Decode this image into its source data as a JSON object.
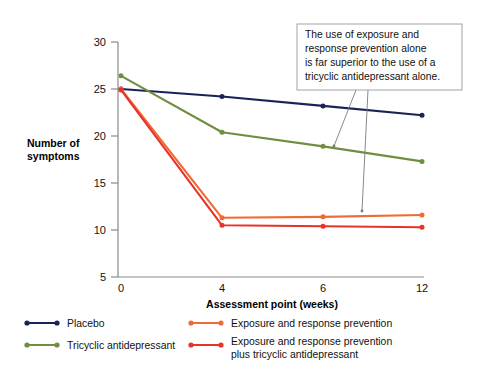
{
  "chart_data": {
    "type": "line",
    "title": "",
    "xlabel": "Assessment point (weeks)",
    "ylabel": "Number of symptoms",
    "categories": [
      "0",
      "4",
      "6",
      "12"
    ],
    "ylim": [
      5,
      30
    ],
    "yticks": [
      5,
      10,
      15,
      20,
      25,
      30
    ],
    "grid": false,
    "legend_position": "bottom",
    "series": [
      {
        "name": "Placebo",
        "color": "#1b2257",
        "values": [
          25.0,
          24.2,
          23.2,
          22.2
        ]
      },
      {
        "name": "Tricyclic antidepressant",
        "color": "#6f8e3f",
        "values": [
          26.4,
          20.4,
          18.9,
          17.3
        ]
      },
      {
        "name": "Exposure and response prevention",
        "color": "#ef6b35",
        "values": [
          25.0,
          11.3,
          11.4,
          11.6
        ]
      },
      {
        "name": "Exposure and response prevention plus tricyclic antidepressant",
        "color": "#e8332a",
        "values": [
          24.9,
          10.5,
          10.4,
          10.3
        ]
      }
    ],
    "annotations": [
      {
        "name": "callout",
        "lines": [
          "The use of exposure and",
          "response prevention alone",
          "is far superior to the use of a",
          "tricyclic antidepressant alone."
        ]
      }
    ]
  },
  "legend": {
    "items": [
      {
        "label": "Placebo",
        "color": "#1b2257"
      },
      {
        "label": "Tricyclic antidepressant",
        "color": "#6f8e3f"
      },
      {
        "label": "Exposure and response prevention",
        "color": "#ef6b35"
      },
      {
        "label": "Exposure and response prevention",
        "label2": "plus tricyclic antidepressant",
        "color": "#e8332a"
      }
    ]
  },
  "axes": {
    "y_title_line1": "Number of",
    "y_title_line2": "symptoms",
    "x_title": "Assessment point (weeks)",
    "y_ticks": [
      "30",
      "25",
      "20",
      "15",
      "10",
      "5"
    ],
    "x_ticks": [
      "0",
      "4",
      "6",
      "12"
    ]
  },
  "callout": {
    "line1": "The use of exposure and",
    "line2": "response prevention alone",
    "line3": "is far superior to the use of a",
    "line4": "tricyclic antidepressant alone."
  }
}
